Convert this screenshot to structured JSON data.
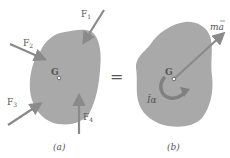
{
  "figure": {
    "panel_a": {
      "caption": "(a)",
      "center_label": "G",
      "forces": [
        {
          "label": "F",
          "sub": "1"
        },
        {
          "label": "F",
          "sub": "2"
        },
        {
          "label": "F",
          "sub": "3"
        },
        {
          "label": "F",
          "sub": "4"
        }
      ]
    },
    "equals": "=",
    "panel_b": {
      "caption": "(b)",
      "center_label": "G",
      "linear_vector_label": "ma",
      "angular_label": "Īα"
    },
    "colors": {
      "body_fill": "#a9a9a9",
      "arrow": "#8a8a8a",
      "text": "#555555"
    }
  }
}
